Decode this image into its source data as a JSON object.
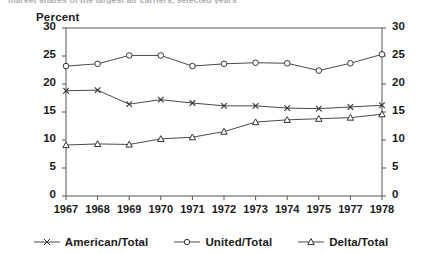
{
  "cut_title": "market shares of the largest air carriers, selected years",
  "axis": {
    "y_title": "Percent",
    "y_ticks": [
      0,
      5,
      10,
      15,
      20,
      25,
      30
    ],
    "y_min": 0,
    "y_max": 30,
    "x_labels": [
      "1967",
      "1968",
      "1969",
      "1970",
      "1971",
      "1972",
      "1973",
      "1974",
      "1975",
      "1977",
      "1978"
    ]
  },
  "legend": {
    "items": [
      {
        "label": "American/Total",
        "marker": "cross-marker",
        "color": "#4a4a4a"
      },
      {
        "label": "United/Total",
        "marker": "circle-marker",
        "color": "#4a4a4a"
      },
      {
        "label": "Delta/Total",
        "marker": "triangle-marker",
        "color": "#4a4a4a"
      }
    ]
  },
  "chart_data": {
    "type": "line",
    "title": "",
    "xlabel": "",
    "ylabel": "Percent",
    "ylim": [
      0,
      30
    ],
    "ytick_step": 5,
    "grid": false,
    "legend_position": "bottom",
    "dual_y_axis": true,
    "categories": [
      "1967",
      "1968",
      "1969",
      "1970",
      "1971",
      "1972",
      "1973",
      "1974",
      "1975",
      "1977",
      "1978"
    ],
    "series": [
      {
        "name": "United/Total",
        "marker": "circle",
        "values": [
          23.2,
          23.6,
          25.1,
          25.1,
          23.2,
          23.6,
          23.8,
          23.7,
          22.4,
          23.7,
          25.3
        ]
      },
      {
        "name": "American/Total",
        "marker": "cross",
        "values": [
          18.8,
          18.9,
          16.4,
          17.2,
          16.6,
          16.1,
          16.1,
          15.7,
          15.6,
          15.9,
          16.2
        ]
      },
      {
        "name": "Delta/Total",
        "marker": "triangle",
        "values": [
          9.1,
          9.3,
          9.2,
          10.2,
          10.5,
          11.5,
          13.2,
          13.6,
          13.8,
          14.0,
          14.6
        ]
      }
    ]
  }
}
